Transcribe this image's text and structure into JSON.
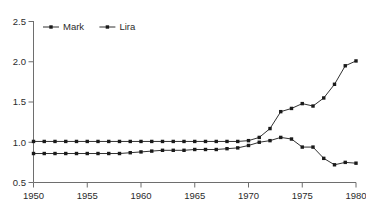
{
  "chart_data": {
    "type": "line",
    "title": "",
    "subtitle": "",
    "xlabel": "",
    "ylabel": "",
    "xlim": [
      1950,
      1980
    ],
    "ylim": [
      0.5,
      2.5
    ],
    "xticks": [
      1950,
      1955,
      1960,
      1965,
      1970,
      1975,
      1980
    ],
    "xtick_labels": [
      "1950",
      "1955",
      "1960",
      "1965",
      "1970",
      "1975",
      "1980"
    ],
    "yticks": [
      0.5,
      1.0,
      1.5,
      2.0,
      2.5
    ],
    "ytick_labels": [
      "0.5",
      "1.0",
      "1.5",
      "2.0",
      "2.5"
    ],
    "grid": false,
    "legend_position": "top-left-inside",
    "marker": "square",
    "line_color": "#1a1a1a",
    "x": [
      1950,
      1951,
      1952,
      1953,
      1954,
      1955,
      1956,
      1957,
      1958,
      1959,
      1960,
      1961,
      1962,
      1963,
      1964,
      1965,
      1966,
      1967,
      1968,
      1969,
      1970,
      1971,
      1972,
      1973,
      1974,
      1975,
      1976,
      1977,
      1978,
      1979,
      1980
    ],
    "series": [
      {
        "name": "Mark",
        "values": [
          1.01,
          1.01,
          1.01,
          1.01,
          1.01,
          1.01,
          1.01,
          1.01,
          1.01,
          1.01,
          1.01,
          1.01,
          1.01,
          1.01,
          1.01,
          1.01,
          1.01,
          1.01,
          1.01,
          1.01,
          1.02,
          1.06,
          1.17,
          1.38,
          1.42,
          1.48,
          1.45,
          1.55,
          1.72,
          1.95,
          2.01
        ]
      },
      {
        "name": "Lira",
        "values": [
          0.86,
          0.86,
          0.86,
          0.86,
          0.86,
          0.86,
          0.86,
          0.86,
          0.86,
          0.87,
          0.88,
          0.89,
          0.9,
          0.9,
          0.9,
          0.91,
          0.91,
          0.91,
          0.92,
          0.93,
          0.96,
          1.0,
          1.02,
          1.06,
          1.04,
          0.94,
          0.94,
          0.8,
          0.72,
          0.75,
          0.74
        ]
      }
    ]
  },
  "legend": {
    "items": [
      {
        "label": "Mark"
      },
      {
        "label": "Lira"
      }
    ]
  }
}
